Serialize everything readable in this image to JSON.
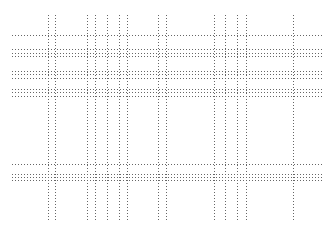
{
  "canvas": {
    "width": 332,
    "height": 234,
    "background": "#ffffff"
  },
  "style": {
    "line_color": "#666666",
    "dash": "1.2 1.8",
    "stroke_width": 1
  },
  "horizontal_lines": {
    "x_start": 12,
    "x_end": 322,
    "y": [
      35,
      49,
      53,
      56,
      71,
      74,
      78,
      89,
      92,
      96,
      164,
      174,
      177,
      180
    ]
  },
  "vertical_lines": {
    "y_start": 15,
    "y_end": 222,
    "x": [
      48,
      55,
      87,
      95,
      107,
      119,
      127,
      158,
      166,
      214,
      225,
      237,
      246,
      293
    ]
  }
}
